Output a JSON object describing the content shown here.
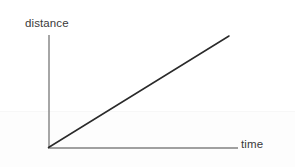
{
  "figure": {
    "background_color": "#ffffff",
    "width": 295,
    "height": 167
  },
  "labels": {
    "y_axis": "distance",
    "x_axis": "time"
  },
  "colors": {
    "axis": "#808080",
    "data_line": "#2a2a2a",
    "label_text": "#3a3a3a",
    "background": "#ffffff"
  },
  "chart_data": {
    "type": "line",
    "title": "",
    "subtitle": "",
    "xlabel": "time",
    "ylabel": "distance",
    "x": [
      0,
      1
    ],
    "series": [
      {
        "name": "distance",
        "values": [
          0,
          1
        ],
        "color": "#2a2a2a"
      }
    ],
    "annotations": [],
    "legend": null,
    "legend_position": "none",
    "grid": false,
    "xlim": [
      0,
      1.05
    ],
    "ylim": [
      0,
      1.05
    ],
    "xticks": [],
    "yticks": [],
    "xticklabels": [],
    "yticklabels": []
  },
  "geometry": {
    "origin": {
      "x": 48,
      "y": 148
    },
    "y_axis_top": {
      "x": 49,
      "y": 35
    },
    "x_axis_right": {
      "x": 238,
      "y": 148
    },
    "data_line_end": {
      "x": 229,
      "y": 36
    },
    "axis_stroke_width": 1.4,
    "data_stroke_width": 1.5
  }
}
